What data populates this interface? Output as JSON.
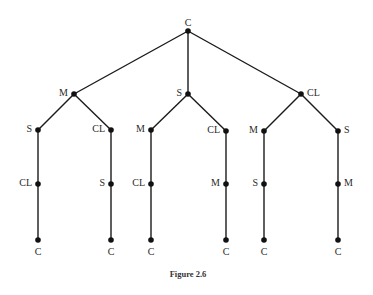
{
  "figure": {
    "caption": "Figure 2.6",
    "colors": {
      "line": "#1a1a1a",
      "node": "#111111",
      "text": "#2a2a2a",
      "background": "#ffffff"
    }
  },
  "tree": {
    "nodes": [
      {
        "id": "n0",
        "label": "C",
        "x": 188,
        "y": 31,
        "lx": 188,
        "ly": 24,
        "anchor": "middle"
      },
      {
        "id": "n1",
        "label": "M",
        "x": 74,
        "y": 94,
        "lx": 68,
        "ly": 94,
        "anchor": "end"
      },
      {
        "id": "n2",
        "label": "S",
        "x": 188,
        "y": 94,
        "lx": 182,
        "ly": 94,
        "anchor": "end"
      },
      {
        "id": "n3",
        "label": "CL",
        "x": 301,
        "y": 94,
        "lx": 307,
        "ly": 94,
        "anchor": "start"
      },
      {
        "id": "n4",
        "label": "S",
        "x": 38,
        "y": 130,
        "lx": 32,
        "ly": 130,
        "anchor": "end"
      },
      {
        "id": "n5",
        "label": "CL",
        "x": 111,
        "y": 130,
        "lx": 105,
        "ly": 130,
        "anchor": "end"
      },
      {
        "id": "n6",
        "label": "M",
        "x": 151,
        "y": 130,
        "lx": 145,
        "ly": 130,
        "anchor": "end"
      },
      {
        "id": "n7",
        "label": "CL",
        "x": 226,
        "y": 131,
        "lx": 220,
        "ly": 131,
        "anchor": "end"
      },
      {
        "id": "n8",
        "label": "M",
        "x": 264,
        "y": 131,
        "lx": 258,
        "ly": 131,
        "anchor": "end"
      },
      {
        "id": "n9",
        "label": "S",
        "x": 338,
        "y": 131,
        "lx": 344,
        "ly": 131,
        "anchor": "start"
      },
      {
        "id": "n10",
        "label": "CL",
        "x": 38,
        "y": 184,
        "lx": 32,
        "ly": 184,
        "anchor": "end"
      },
      {
        "id": "n11",
        "label": "S",
        "x": 111,
        "y": 184,
        "lx": 105,
        "ly": 184,
        "anchor": "end"
      },
      {
        "id": "n12",
        "label": "CL",
        "x": 151,
        "y": 184,
        "lx": 145,
        "ly": 184,
        "anchor": "end"
      },
      {
        "id": "n13",
        "label": "M",
        "x": 226,
        "y": 184,
        "lx": 220,
        "ly": 184,
        "anchor": "end"
      },
      {
        "id": "n14",
        "label": "S",
        "x": 264,
        "y": 184,
        "lx": 258,
        "ly": 184,
        "anchor": "end"
      },
      {
        "id": "n15",
        "label": "M",
        "x": 338,
        "y": 184,
        "lx": 344,
        "ly": 184,
        "anchor": "start"
      },
      {
        "id": "n16",
        "label": "C",
        "x": 38,
        "y": 240,
        "lx": 38,
        "ly": 253,
        "anchor": "middle"
      },
      {
        "id": "n17",
        "label": "C",
        "x": 111,
        "y": 240,
        "lx": 111,
        "ly": 253,
        "anchor": "middle"
      },
      {
        "id": "n18",
        "label": "C",
        "x": 151,
        "y": 240,
        "lx": 151,
        "ly": 253,
        "anchor": "middle"
      },
      {
        "id": "n19",
        "label": "C",
        "x": 226,
        "y": 240,
        "lx": 226,
        "ly": 253,
        "anchor": "middle"
      },
      {
        "id": "n20",
        "label": "C",
        "x": 264,
        "y": 240,
        "lx": 264,
        "ly": 253,
        "anchor": "middle"
      },
      {
        "id": "n21",
        "label": "C",
        "x": 338,
        "y": 240,
        "lx": 338,
        "ly": 253,
        "anchor": "middle"
      }
    ],
    "edges": [
      [
        "n0",
        "n1"
      ],
      [
        "n0",
        "n2"
      ],
      [
        "n0",
        "n3"
      ],
      [
        "n1",
        "n4"
      ],
      [
        "n1",
        "n5"
      ],
      [
        "n2",
        "n6"
      ],
      [
        "n2",
        "n7"
      ],
      [
        "n3",
        "n8"
      ],
      [
        "n3",
        "n9"
      ],
      [
        "n4",
        "n10"
      ],
      [
        "n5",
        "n11"
      ],
      [
        "n6",
        "n12"
      ],
      [
        "n7",
        "n13"
      ],
      [
        "n8",
        "n14"
      ],
      [
        "n9",
        "n15"
      ],
      [
        "n10",
        "n16"
      ],
      [
        "n11",
        "n17"
      ],
      [
        "n12",
        "n18"
      ],
      [
        "n13",
        "n19"
      ],
      [
        "n14",
        "n20"
      ],
      [
        "n15",
        "n21"
      ]
    ]
  }
}
